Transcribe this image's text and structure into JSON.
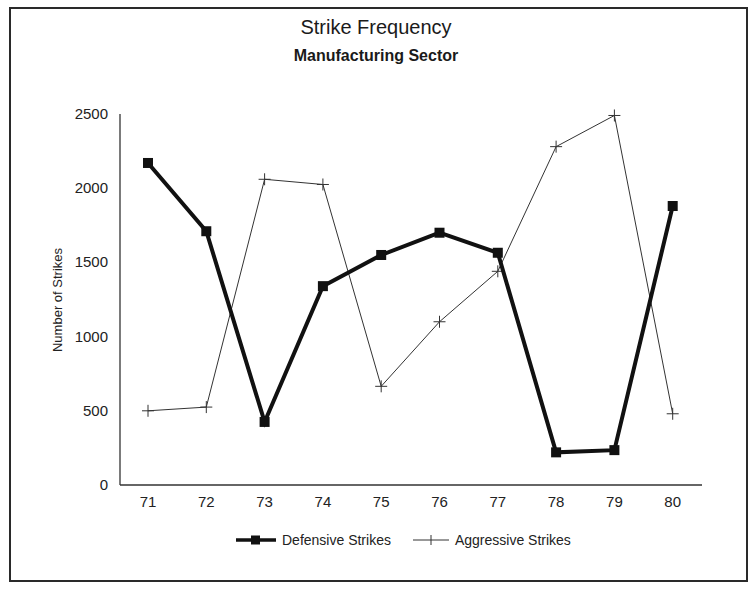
{
  "chart_data": {
    "type": "line",
    "title": "Strike Frequency",
    "subtitle": "Manufacturing Sector",
    "xlabel": "",
    "ylabel": "Number of Strikes",
    "categories": [
      "71",
      "72",
      "73",
      "74",
      "75",
      "76",
      "77",
      "78",
      "79",
      "80"
    ],
    "series": [
      {
        "name": "Defensive Strikes",
        "marker": "square",
        "line_weight": "thick",
        "color": "#111111",
        "values": [
          2170,
          1710,
          425,
          1340,
          1550,
          1700,
          1565,
          220,
          235,
          1880
        ]
      },
      {
        "name": "Aggressive Strikes",
        "marker": "plus",
        "line_weight": "thin",
        "color": "#333333",
        "values": [
          500,
          525,
          2060,
          2025,
          665,
          1100,
          1440,
          2280,
          2490,
          480
        ]
      }
    ],
    "yticks": [
      "0",
      "500",
      "1000",
      "1500",
      "2000",
      "2500"
    ],
    "ylim": [
      0,
      2500
    ],
    "grid": false,
    "legend_position": "bottom"
  },
  "legend": {
    "defensive_label": "Defensive Strikes",
    "aggressive_label": "Aggressive Strikes"
  }
}
